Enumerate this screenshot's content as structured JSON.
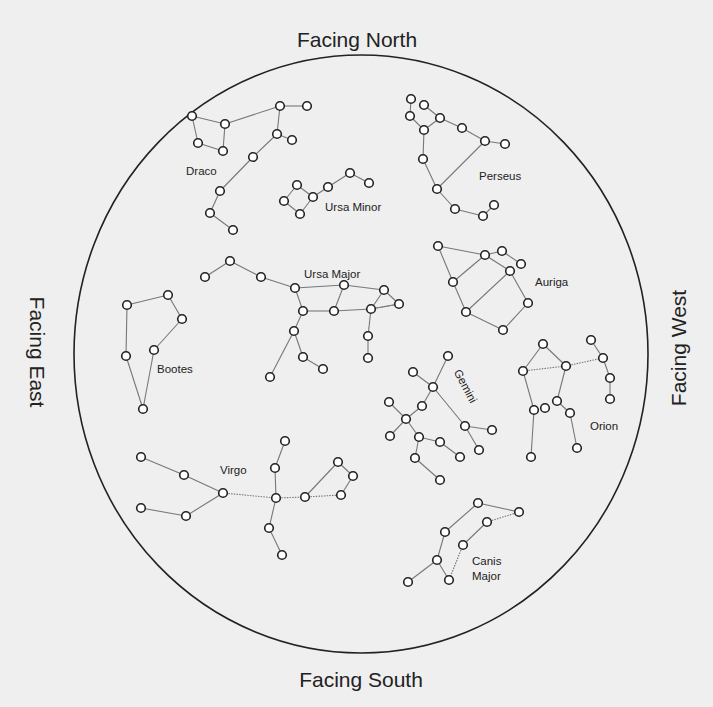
{
  "title_clipped": "",
  "directions": {
    "north": "Facing North",
    "south": "Facing South",
    "east": "Facing East",
    "west": "Facing West"
  },
  "sky_circle": {
    "cx": 361,
    "cy": 354,
    "rx": 287,
    "ry": 299
  },
  "colors": {
    "background": "#efefef",
    "outline": "#222222",
    "line": "#777777",
    "star_fill": "#ffffff"
  },
  "constellations": [
    {
      "name": "Draco",
      "label": {
        "text": "Draco",
        "x": 186,
        "y": 175,
        "rotate": 0
      },
      "stars": [
        [
          192,
          116
        ],
        [
          225,
          124
        ],
        [
          198,
          143
        ],
        [
          223,
          151
        ],
        [
          280,
          106
        ],
        [
          307,
          106
        ],
        [
          277,
          134
        ],
        [
          292,
          140
        ],
        [
          253,
          157
        ],
        [
          220,
          191
        ],
        [
          210,
          213
        ],
        [
          233,
          230
        ]
      ],
      "links": [
        [
          0,
          1
        ],
        [
          0,
          2
        ],
        [
          2,
          3
        ],
        [
          3,
          1
        ],
        [
          1,
          4
        ],
        [
          4,
          5
        ],
        [
          4,
          6
        ],
        [
          6,
          7
        ],
        [
          6,
          8
        ],
        [
          8,
          9
        ],
        [
          9,
          10
        ],
        [
          10,
          11
        ]
      ]
    },
    {
      "name": "Ursa Minor",
      "label": {
        "text": "Ursa Minor",
        "x": 325,
        "y": 211,
        "rotate": 0
      },
      "stars": [
        [
          297,
          185
        ],
        [
          284,
          201
        ],
        [
          300,
          214
        ],
        [
          313,
          197
        ],
        [
          328,
          187
        ],
        [
          350,
          173
        ],
        [
          369,
          183
        ]
      ],
      "links": [
        [
          0,
          1
        ],
        [
          1,
          2
        ],
        [
          2,
          3
        ],
        [
          3,
          0
        ],
        [
          3,
          4
        ],
        [
          4,
          5
        ],
        [
          5,
          6
        ]
      ]
    },
    {
      "name": "Perseus",
      "label": {
        "text": "Perseus",
        "x": 479,
        "y": 180,
        "rotate": 0
      },
      "stars": [
        [
          411,
          99
        ],
        [
          424,
          105
        ],
        [
          410,
          116
        ],
        [
          440,
          118
        ],
        [
          424,
          130
        ],
        [
          462,
          128
        ],
        [
          485,
          141
        ],
        [
          505,
          144
        ],
        [
          423,
          159
        ],
        [
          437,
          189
        ],
        [
          455,
          209
        ],
        [
          483,
          216
        ],
        [
          494,
          205
        ]
      ],
      "links": [
        [
          0,
          2
        ],
        [
          2,
          4
        ],
        [
          1,
          3
        ],
        [
          3,
          4
        ],
        [
          3,
          5
        ],
        [
          5,
          6
        ],
        [
          6,
          7
        ],
        [
          4,
          8
        ],
        [
          8,
          9
        ],
        [
          9,
          6
        ],
        [
          9,
          10
        ],
        [
          10,
          11
        ],
        [
          11,
          12
        ]
      ]
    },
    {
      "name": "Auriga",
      "label": {
        "text": "Auriga",
        "x": 535,
        "y": 286,
        "rotate": 0
      },
      "stars": [
        [
          438,
          246
        ],
        [
          485,
          255
        ],
        [
          502,
          251
        ],
        [
          521,
          264
        ],
        [
          510,
          271
        ],
        [
          453,
          282
        ],
        [
          466,
          312
        ],
        [
          528,
          303
        ],
        [
          503,
          330
        ]
      ],
      "links": [
        [
          0,
          1
        ],
        [
          1,
          2
        ],
        [
          2,
          3
        ],
        [
          1,
          4
        ],
        [
          0,
          5
        ],
        [
          1,
          5
        ],
        [
          5,
          6
        ],
        [
          6,
          4
        ],
        [
          4,
          7
        ],
        [
          7,
          8
        ],
        [
          8,
          6
        ]
      ]
    },
    {
      "name": "Ursa Major",
      "label": {
        "text": "Ursa Major",
        "x": 304,
        "y": 278,
        "rotate": 0
      },
      "stars": [
        [
          205,
          277
        ],
        [
          230,
          261
        ],
        [
          261,
          277
        ],
        [
          295,
          288
        ],
        [
          344,
          285
        ],
        [
          384,
          290
        ],
        [
          399,
          304
        ],
        [
          303,
          311
        ],
        [
          334,
          311
        ],
        [
          371,
          309
        ],
        [
          294,
          331
        ],
        [
          368,
          336
        ],
        [
          303,
          357
        ],
        [
          368,
          358
        ],
        [
          323,
          369
        ],
        [
          270,
          377
        ]
      ],
      "links": [
        [
          0,
          1
        ],
        [
          1,
          2
        ],
        [
          2,
          3
        ],
        [
          3,
          4
        ],
        [
          4,
          5
        ],
        [
          5,
          6
        ],
        [
          3,
          7
        ],
        [
          7,
          8
        ],
        [
          8,
          4
        ],
        [
          8,
          9
        ],
        [
          9,
          5
        ],
        [
          9,
          6
        ],
        [
          7,
          10
        ],
        [
          10,
          12
        ],
        [
          12,
          14
        ],
        [
          10,
          15
        ],
        [
          9,
          11
        ],
        [
          11,
          13
        ]
      ],
      "dotted_links": [
        [
          9,
          6
        ]
      ]
    },
    {
      "name": "Bootes",
      "label": {
        "text": "Bootes",
        "x": 157,
        "y": 373,
        "rotate": 0
      },
      "stars": [
        [
          127,
          305
        ],
        [
          168,
          295
        ],
        [
          182,
          319
        ],
        [
          154,
          350
        ],
        [
          126,
          356
        ],
        [
          143,
          409
        ]
      ],
      "links": [
        [
          0,
          1
        ],
        [
          1,
          2
        ],
        [
          2,
          3
        ],
        [
          0,
          4
        ],
        [
          4,
          5
        ],
        [
          3,
          5
        ]
      ]
    },
    {
      "name": "Gemini",
      "label": {
        "text": "Gemini",
        "x": 462,
        "y": 388,
        "rotate": 62
      },
      "stars": [
        [
          448,
          356
        ],
        [
          413,
          372
        ],
        [
          433,
          387
        ],
        [
          389,
          402
        ],
        [
          422,
          406
        ],
        [
          406,
          419
        ],
        [
          390,
          436
        ],
        [
          465,
          426
        ],
        [
          492,
          430
        ],
        [
          419,
          437
        ],
        [
          440,
          442
        ],
        [
          479,
          450
        ],
        [
          415,
          458
        ],
        [
          460,
          457
        ],
        [
          440,
          480
        ]
      ],
      "links": [
        [
          0,
          2
        ],
        [
          1,
          2
        ],
        [
          2,
          4
        ],
        [
          4,
          5
        ],
        [
          3,
          5
        ],
        [
          5,
          6
        ],
        [
          2,
          7
        ],
        [
          7,
          8
        ],
        [
          7,
          11
        ],
        [
          5,
          9
        ],
        [
          9,
          10
        ],
        [
          10,
          13
        ],
        [
          9,
          12
        ],
        [
          12,
          14
        ]
      ]
    },
    {
      "name": "Orion",
      "label": {
        "text": "Orion",
        "x": 590,
        "y": 430,
        "rotate": 0
      },
      "stars": [
        [
          543,
          344
        ],
        [
          523,
          371
        ],
        [
          566,
          366
        ],
        [
          591,
          340
        ],
        [
          603,
          358
        ],
        [
          610,
          378
        ],
        [
          610,
          399
        ],
        [
          557,
          401
        ],
        [
          545,
          408
        ],
        [
          534,
          410
        ],
        [
          570,
          413
        ],
        [
          577,
          448
        ],
        [
          531,
          457
        ]
      ],
      "links": [
        [
          0,
          1
        ],
        [
          0,
          2
        ],
        [
          3,
          4
        ],
        [
          4,
          5
        ],
        [
          5,
          6
        ],
        [
          2,
          7
        ],
        [
          7,
          10
        ],
        [
          10,
          11
        ],
        [
          1,
          9
        ],
        [
          9,
          12
        ]
      ],
      "dotted_links": [
        [
          1,
          2
        ],
        [
          2,
          4
        ]
      ]
    },
    {
      "name": "Virgo",
      "label": {
        "text": "Virgo",
        "x": 220,
        "y": 474,
        "rotate": 0
      },
      "stars": [
        [
          141,
          457
        ],
        [
          184,
          475
        ],
        [
          223,
          493
        ],
        [
          141,
          508
        ],
        [
          186,
          516
        ],
        [
          285,
          441
        ],
        [
          275,
          468
        ],
        [
          276,
          498
        ],
        [
          305,
          497
        ],
        [
          338,
          462
        ],
        [
          353,
          476
        ],
        [
          341,
          495
        ],
        [
          269,
          528
        ],
        [
          282,
          555
        ]
      ],
      "links": [
        [
          0,
          1
        ],
        [
          1,
          2
        ],
        [
          3,
          4
        ],
        [
          4,
          2
        ],
        [
          5,
          6
        ],
        [
          6,
          7
        ],
        [
          8,
          9
        ],
        [
          9,
          10
        ],
        [
          10,
          11
        ],
        [
          7,
          12
        ],
        [
          12,
          13
        ]
      ],
      "dotted_links": [
        [
          2,
          7
        ],
        [
          7,
          8
        ],
        [
          8,
          11
        ]
      ]
    },
    {
      "name": "Canis Major",
      "label": {
        "text": "Canis",
        "text2": "Major",
        "x": 472,
        "y": 565,
        "rotate": 0
      },
      "stars": [
        [
          478,
          503
        ],
        [
          519,
          512
        ],
        [
          487,
          522
        ],
        [
          445,
          532
        ],
        [
          463,
          545
        ],
        [
          437,
          560
        ],
        [
          449,
          580
        ],
        [
          408,
          582
        ]
      ],
      "links": [
        [
          0,
          3
        ],
        [
          3,
          5
        ],
        [
          5,
          7
        ],
        [
          5,
          6
        ],
        [
          2,
          4
        ],
        [
          0,
          1
        ]
      ],
      "dotted_links": [
        [
          1,
          2
        ],
        [
          4,
          6
        ]
      ]
    }
  ]
}
